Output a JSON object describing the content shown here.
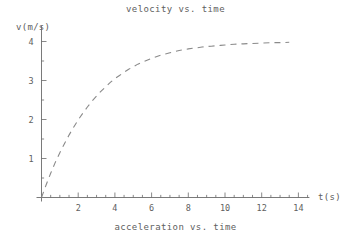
{
  "chart_data": {
    "type": "line",
    "title": "velocity vs. time",
    "caption": "acceleration vs. time",
    "xlabel": "t(s)",
    "ylabel": "v(m/s)",
    "xlim": [
      0,
      14.6
    ],
    "ylim": [
      0,
      4.3
    ],
    "xticks": [
      2,
      4,
      6,
      8,
      10,
      12,
      14
    ],
    "yticks": [
      1,
      2,
      3,
      4
    ],
    "xtick_labels": [
      "2",
      "4",
      "6",
      "8",
      "10",
      "12",
      "14"
    ],
    "ytick_labels": [
      "1",
      "2",
      "3",
      "4"
    ],
    "minor_tick_step": 0.5,
    "grid": false,
    "legend": null,
    "line_style": "dashed",
    "line_color": "#8a8a8a",
    "axis_color": "#6b6b6b",
    "background_color": "#ffffff",
    "series": [
      {
        "name": "velocity",
        "x": [
          0.0,
          0.25,
          0.5,
          0.75,
          1.0,
          1.25,
          1.5,
          1.75,
          2.0,
          2.25,
          2.5,
          2.75,
          3.0,
          3.25,
          3.5,
          3.75,
          4.0,
          4.25,
          4.5,
          4.75,
          5.0,
          5.25,
          5.5,
          5.75,
          6.0,
          6.25,
          6.5,
          6.75,
          7.0,
          7.25,
          7.5,
          7.75,
          8.0,
          8.25,
          8.5,
          8.75,
          9.0,
          9.25,
          9.5,
          9.75,
          10.0,
          10.5,
          11.0,
          11.5,
          12.0,
          12.5,
          13.0,
          13.5
        ],
        "y": [
          0.0,
          0.32,
          0.62,
          0.9,
          1.15,
          1.38,
          1.6,
          1.8,
          1.99,
          2.16,
          2.32,
          2.47,
          2.6,
          2.73,
          2.84,
          2.95,
          3.05,
          3.13,
          3.21,
          3.29,
          3.35,
          3.42,
          3.47,
          3.52,
          3.57,
          3.61,
          3.65,
          3.68,
          3.71,
          3.74,
          3.77,
          3.79,
          3.81,
          3.83,
          3.84,
          3.86,
          3.87,
          3.88,
          3.89,
          3.9,
          3.91,
          3.93,
          3.94,
          3.95,
          3.96,
          3.97,
          3.97,
          3.98
        ]
      }
    ],
    "asymptote": 4.0
  }
}
